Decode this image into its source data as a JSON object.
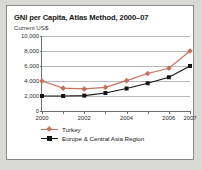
{
  "figure": {
    "title": "GNI per Capita, Atlas Method, 2000–07",
    "subtitle": "Current US$"
  },
  "colors": {
    "turkey": "#c8705a",
    "eca": "#141414",
    "gridline": "#b9b9b9",
    "axis": "#6e6e6e",
    "page_background": "#d9d9d5",
    "card_background": "#ffffff",
    "card_border": "#8d8d8d"
  },
  "chart_data": {
    "type": "line",
    "title": "GNI per Capita, Atlas Method, 2000–07",
    "subtitle": "Current US$",
    "xlabel": "",
    "ylabel": "Current US$",
    "x": [
      2000,
      2001,
      2002,
      2003,
      2004,
      2005,
      2006,
      2007
    ],
    "xtick_labels": [
      "2000",
      "",
      "2002",
      "",
      "2004",
      "",
      "2006",
      "2007"
    ],
    "ytick_labels": [
      "0",
      "2,000",
      "4,000",
      "6,000",
      "8,000",
      "10,000"
    ],
    "yticks": [
      0,
      2000,
      4000,
      6000,
      8000,
      10000
    ],
    "xlim": [
      2000,
      2007
    ],
    "ylim": [
      0,
      10000
    ],
    "grid": "horizontal",
    "legend_position": "below-axes-left",
    "series": [
      {
        "name": "Turkey",
        "color": "#c8705a",
        "marker": "diamond",
        "values": [
          4000,
          3050,
          2950,
          3150,
          4050,
          5000,
          5700,
          8000
        ]
      },
      {
        "name": "Europe & Central Asia Region",
        "color": "#141414",
        "marker": "square",
        "values": [
          2000,
          2000,
          2050,
          2400,
          3000,
          3700,
          4500,
          6000
        ]
      }
    ]
  }
}
